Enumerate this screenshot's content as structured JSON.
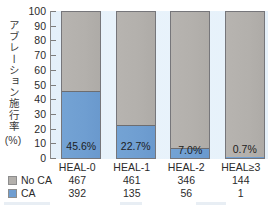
{
  "chart_data": {
    "type": "bar",
    "subtype": "stacked-100-percent",
    "title": "",
    "xlabel": "",
    "ylabel": "アブレーション施行率",
    "ylabel_unit": "(%)",
    "ylim": [
      0,
      100
    ],
    "ytick_step": 10,
    "grid": false,
    "legend_position": "bottom-left",
    "categories": [
      "HEAL-0",
      "HEAL-1",
      "HEAL-2",
      "HEAL≥3"
    ],
    "ytick_labels": [
      "100",
      "90",
      "80",
      "70",
      "60",
      "50",
      "40",
      "30",
      "20",
      "10",
      "0"
    ],
    "series": [
      {
        "name": "No CA",
        "color": "#b3b0ac",
        "counts": [
          467,
          461,
          346,
          144
        ],
        "values": [
          54.4,
          77.3,
          93.0,
          99.3
        ]
      },
      {
        "name": "CA",
        "color": "#6f9ed1",
        "counts": [
          392,
          135,
          56,
          1
        ],
        "values": [
          45.6,
          22.7,
          7.0,
          0.7
        ]
      }
    ],
    "data_labels": [
      "45.6%",
      "22.7%",
      "7.0%",
      "0.7%"
    ],
    "plot_background": "#e6f1fa",
    "axis_color": "#8a8a8a"
  },
  "axis": {
    "y_title_text": "アブレーション施行率",
    "y_title_unit": "(%)",
    "ticks": [
      "100",
      "90",
      "80",
      "70",
      "60",
      "50",
      "40",
      "30",
      "20",
      "10",
      "0"
    ]
  },
  "categories": [
    {
      "label": "HEAL-0"
    },
    {
      "label": "HEAL-1"
    },
    {
      "label": "HEAL-2"
    },
    {
      "label": "HEAL≥3"
    }
  ],
  "bars": [
    {
      "category": "HEAL-0",
      "ca_pct": 45.6,
      "noca_pct": 54.4,
      "label": "45.6%",
      "label_placement": "in-ca"
    },
    {
      "category": "HEAL-1",
      "ca_pct": 22.7,
      "noca_pct": 77.3,
      "label": "22.7%",
      "label_placement": "in-ca"
    },
    {
      "category": "HEAL-2",
      "ca_pct": 7.0,
      "noca_pct": 93.0,
      "label": "7.0%",
      "label_placement": "in-ca-low"
    },
    {
      "category": "HEAL≥3",
      "ca_pct": 0.7,
      "noca_pct": 99.3,
      "label": "0.7%",
      "label_placement": "on-gray"
    }
  ],
  "legend": {
    "rows": [
      {
        "name": "No CA",
        "swatch": "gray",
        "color": "#b3b0ac",
        "values": [
          "467",
          "461",
          "346",
          "144"
        ]
      },
      {
        "name": "CA",
        "swatch": "blue",
        "color": "#6f9ed1",
        "values": [
          "392",
          "135",
          "56",
          "1"
        ]
      }
    ]
  },
  "colors": {
    "ca": "#6f9ed1",
    "no_ca": "#b3b0ac",
    "plot_bg": "#e6f1fa",
    "text": "#2b2b2b"
  }
}
